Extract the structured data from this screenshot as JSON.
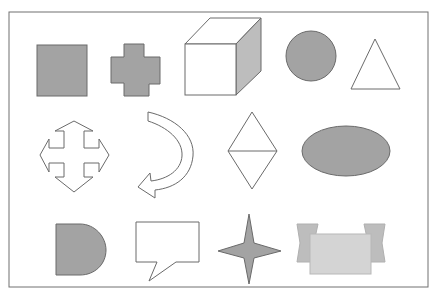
{
  "colors": {
    "background": "#ffffff",
    "frame_stroke": "#707070",
    "shape_stroke": "#6a6a6a",
    "fill_dark": "#a3a3a3",
    "fill_light": "#d4d4d4",
    "fill_light_side": "#bdbdbd",
    "fill_none": "#ffffff"
  },
  "shapes": [
    {
      "row": 1,
      "col": 1,
      "name": "square",
      "fill": "dark"
    },
    {
      "row": 1,
      "col": 2,
      "name": "plus-cross",
      "fill": "dark"
    },
    {
      "row": 1,
      "col": 3,
      "name": "cube",
      "fill": "none+dark-side"
    },
    {
      "row": 1,
      "col": 4,
      "name": "circle",
      "fill": "dark"
    },
    {
      "row": 1,
      "col": 5,
      "name": "triangle",
      "fill": "none"
    },
    {
      "row": 2,
      "col": 1,
      "name": "four-way-arrow",
      "fill": "none"
    },
    {
      "row": 2,
      "col": 2,
      "name": "curved-arrow",
      "fill": "none"
    },
    {
      "row": 2,
      "col": 3,
      "name": "diamond",
      "fill": "none"
    },
    {
      "row": 2,
      "col": 4,
      "name": "ellipse",
      "fill": "dark"
    },
    {
      "row": 3,
      "col": 1,
      "name": "half-circle-d",
      "fill": "dark"
    },
    {
      "row": 3,
      "col": 2,
      "name": "speech-bubble",
      "fill": "none"
    },
    {
      "row": 3,
      "col": 3,
      "name": "four-point-star",
      "fill": "dark"
    },
    {
      "row": 3,
      "col": 4,
      "name": "ribbon-banner",
      "fill": "light"
    }
  ]
}
